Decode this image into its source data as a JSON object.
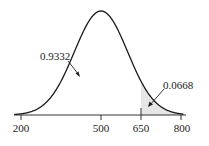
{
  "chart_data": {
    "type": "area",
    "title": "",
    "xlabel": "",
    "ylabel": "",
    "distribution": "normal",
    "mean": 500,
    "sd": 100,
    "xlim": [
      200,
      800
    ],
    "x_ticks": [
      200,
      500,
      650,
      800
    ],
    "x_tick_labels": [
      "200",
      "500",
      "650",
      "800"
    ],
    "shaded_region": {
      "from": 650,
      "to": 800,
      "color": "#e6e6e6"
    },
    "annotations": [
      {
        "text": "0.9332",
        "region": "left of 650",
        "points_to": "unshaded area under curve"
      },
      {
        "text": "0.0668",
        "region": "right of 650",
        "points_to": "shaded tail area"
      }
    ],
    "grid": false,
    "legend": null
  },
  "labels": {
    "tick_200": "200",
    "tick_500": "500",
    "tick_650": "650",
    "tick_800": "800",
    "left_area": "0.9332",
    "right_area": "0.0668"
  },
  "colors": {
    "curve": "#1a1a1a",
    "axis": "#333333",
    "shade": "#e6e6e6"
  }
}
